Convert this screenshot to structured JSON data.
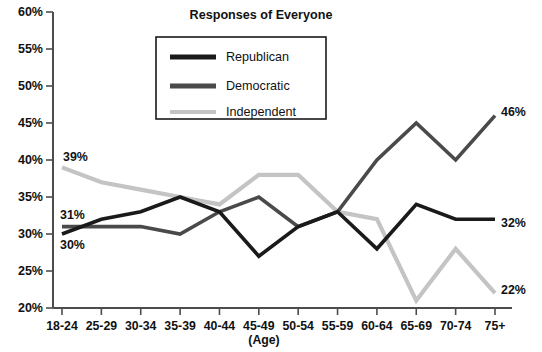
{
  "chart_data": {
    "type": "line",
    "title": "Responses of Everyone",
    "xlabel": "(Age)",
    "ylabel": "",
    "categories": [
      "18-24",
      "25-29",
      "30-34",
      "35-39",
      "40-44",
      "45-49",
      "50-54",
      "55-59",
      "60-64",
      "65-69",
      "70-74",
      "75+"
    ],
    "x": [
      "18-24",
      "25-29",
      "30-34",
      "35-39",
      "40-44",
      "45-49",
      "50-54",
      "55-59",
      "60-64",
      "65-69",
      "70-74",
      "75+"
    ],
    "ylim": [
      20,
      60
    ],
    "ytick_step": 5,
    "ytick_labels": [
      "20%",
      "25%",
      "30%",
      "35%",
      "40%",
      "45%",
      "50%",
      "55%",
      "60%"
    ],
    "ytick_values": [
      20,
      25,
      30,
      35,
      40,
      45,
      50,
      55,
      60
    ],
    "grid": false,
    "legend_position": "top-center",
    "series": [
      {
        "name": "Republican",
        "color": "#1a1a1a",
        "values": [
          30,
          32,
          33,
          35,
          33,
          27,
          31,
          33,
          28,
          34,
          32,
          32
        ]
      },
      {
        "name": "Democratic",
        "color": "#4a4a4a",
        "values": [
          31,
          31,
          31,
          30,
          33,
          35,
          31,
          33,
          40,
          45,
          40,
          46
        ]
      },
      {
        "name": "Independent",
        "color": "#c4c4c4",
        "values": [
          39,
          37,
          36,
          35,
          34,
          38,
          38,
          33,
          32,
          21,
          28,
          22
        ]
      }
    ],
    "annotations": [
      {
        "text": "39%",
        "series": "Independent",
        "point": "18-24",
        "side": "left"
      },
      {
        "text": "31%",
        "series": "Democratic",
        "point": "18-24",
        "side": "left"
      },
      {
        "text": "30%",
        "series": "Republican",
        "point": "18-24",
        "side": "left"
      },
      {
        "text": "46%",
        "series": "Democratic",
        "point": "75+",
        "side": "right"
      },
      {
        "text": "32%",
        "series": "Republican",
        "point": "75+",
        "side": "right"
      },
      {
        "text": "22%",
        "series": "Independent",
        "point": "75+",
        "side": "right"
      }
    ]
  },
  "legend": {
    "entries": [
      {
        "label": "Republican",
        "color": "#1a1a1a"
      },
      {
        "label": "Democratic",
        "color": "#4a4a4a"
      },
      {
        "label": "Independent",
        "color": "#c4c4c4"
      }
    ]
  },
  "annotation_labels": {
    "independent_start": "39%",
    "democratic_start": "31%",
    "republican_start": "30%",
    "democratic_end": "46%",
    "republican_end": "32%",
    "independent_end": "22%"
  }
}
